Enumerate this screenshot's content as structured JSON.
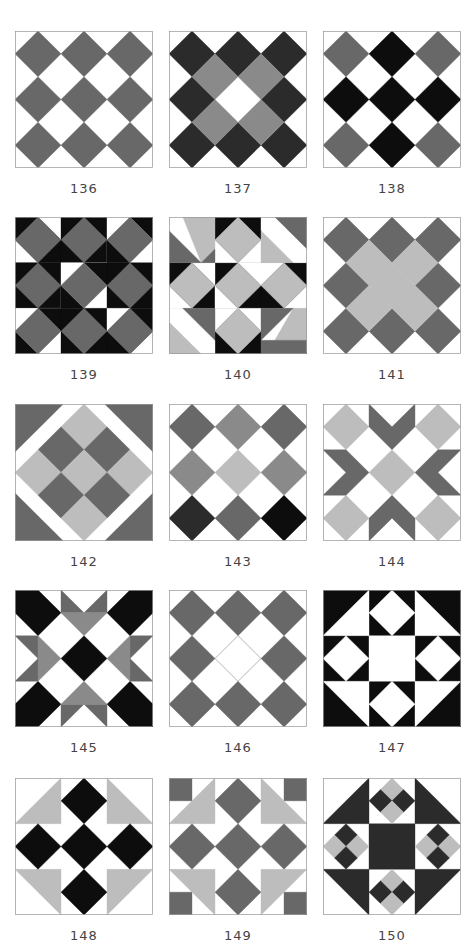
{
  "colors": {
    "white": "#ffffff",
    "black": "#0d0d0d",
    "dark": "#2b2b2b",
    "mid": "#686868",
    "gray": "#8a8a8a",
    "light": "#bdbdbd",
    "border": "#9a9a9a"
  },
  "layout": {
    "columns_x": [
      15,
      169,
      323
    ],
    "rows_y": [
      31,
      217,
      404,
      590,
      778
    ],
    "label_offset_y": 150
  },
  "blocks": [
    {
      "label": "136",
      "shapes": [
        {
          "c": "mid",
          "p": "0.5,0 1,0.5 0.5,1 0,0.5"
        },
        {
          "c": "mid",
          "p": "1.5,0 2,0.5 1.5,1 1,0.5"
        },
        {
          "c": "mid",
          "p": "2.5,0 3,0.5 2.5,1 2,0.5"
        },
        {
          "c": "mid",
          "p": "0.5,1 1,1.5 0.5,2 0,1.5"
        },
        {
          "c": "mid",
          "p": "1.5,1 2,1.5 1.5,2 1,1.5"
        },
        {
          "c": "mid",
          "p": "2.5,1 3,1.5 2.5,2 2,1.5"
        },
        {
          "c": "mid",
          "p": "0.5,2 1,2.5 0.5,3 0,2.5"
        },
        {
          "c": "mid",
          "p": "1.5,2 2,2.5 1.5,3 1,2.5"
        },
        {
          "c": "mid",
          "p": "2.5,2 3,2.5 2.5,3 2,2.5"
        }
      ]
    },
    {
      "label": "137",
      "shapes": [
        {
          "c": "dark",
          "p": "0.5,0 1,0.5 0.5,1 0,0.5"
        },
        {
          "c": "dark",
          "p": "1.5,0 2,0.5 1.5,1 1,0.5"
        },
        {
          "c": "dark",
          "p": "2.5,0 3,0.5 2.5,1 2,0.5"
        },
        {
          "c": "dark",
          "p": "0.5,1 1,1.5 0.5,2 0,1.5"
        },
        {
          "c": "dark",
          "p": "2.5,1 3,1.5 2.5,2 2,1.5"
        },
        {
          "c": "dark",
          "p": "0.5,2 1,2.5 0.5,3 0,2.5"
        },
        {
          "c": "dark",
          "p": "1.5,2 2,2.5 1.5,3 1,2.5"
        },
        {
          "c": "dark",
          "p": "2.5,2 3,2.5 2.5,3 2,2.5"
        },
        {
          "c": "gray",
          "p": "1,0.5 1.5,1 1,1.5 0.5,1"
        },
        {
          "c": "gray",
          "p": "2,0.5 2.5,1 2,1.5 1.5,1"
        },
        {
          "c": "gray",
          "p": "1,1.5 1.5,2 1,2.5 0.5,2"
        },
        {
          "c": "gray",
          "p": "2,1.5 2.5,2 2,2.5 1.5,2"
        }
      ]
    },
    {
      "label": "138",
      "shapes": [
        {
          "c": "mid",
          "p": "0.5,0 1,0.5 0.5,1 0,0.5"
        },
        {
          "c": "black",
          "p": "1.5,0 2,0.5 1.5,1 1,0.5"
        },
        {
          "c": "mid",
          "p": "2.5,0 3,0.5 2.5,1 2,0.5"
        },
        {
          "c": "black",
          "p": "0.5,1 1,1.5 0.5,2 0,1.5"
        },
        {
          "c": "black",
          "p": "1.5,1 2,1.5 1.5,2 1,1.5"
        },
        {
          "c": "black",
          "p": "2.5,1 3,1.5 2.5,2 2,1.5"
        },
        {
          "c": "mid",
          "p": "0.5,2 1,2.5 0.5,3 0,2.5"
        },
        {
          "c": "black",
          "p": "1.5,2 2,2.5 1.5,3 1,2.5"
        },
        {
          "c": "mid",
          "p": "2.5,2 3,2.5 2.5,3 2,2.5"
        }
      ]
    },
    {
      "label": "139",
      "shapes": [
        {
          "c": "black",
          "p": "0,0 1,0 1,1 0,1"
        },
        {
          "c": "white",
          "p": "0,0.5 0.5,1 0,1"
        },
        {
          "c": "white",
          "p": "1,0 1,0.5 0.5,0"
        },
        {
          "c": "black",
          "p": "1,0 2,0 2,1 1,1"
        },
        {
          "c": "white",
          "p": "2,0 3,0 3,1 2,1"
        },
        {
          "c": "black",
          "p": "2.5,0 3,0 3,0.5"
        },
        {
          "c": "black",
          "p": "2,0.5 2.5,1 2,1"
        },
        {
          "c": "black",
          "p": "0,1 1,1 1,2 0,2"
        },
        {
          "c": "white",
          "p": "1,1 2,1 2,2 1,2"
        },
        {
          "c": "black",
          "p": "1.5,1 2,1 2,1.5"
        },
        {
          "c": "black",
          "p": "1,1.5 1.5,2 1,2"
        },
        {
          "c": "black",
          "p": "2,1 3,1 3,2 2,2"
        },
        {
          "c": "white",
          "p": "0,2 1,2 1,3 0,3"
        },
        {
          "c": "black",
          "p": "0,2.5 0.5,3 0,3"
        },
        {
          "c": "black",
          "p": "0.5,2 1,2 1,2.5"
        },
        {
          "c": "black",
          "p": "1,2 2,2 2,3 1,3"
        },
        {
          "c": "black",
          "p": "2,2 3,2 3,3 2,3"
        },
        {
          "c": "white",
          "p": "2,2 2.5,2 2,2.5"
        },
        {
          "c": "white",
          "p": "3,2.5 3,3 2.5,3"
        },
        {
          "c": "mid",
          "p": "0.5,0 1,0.5 0.5,1 0,0.5"
        },
        {
          "c": "mid",
          "p": "1.5,0 2,0.5 1.5,1 1,0.5"
        },
        {
          "c": "mid",
          "p": "2.5,0 3,0.5 2.5,1 2,0.5"
        },
        {
          "c": "mid",
          "p": "0.5,1 1,1.5 0.5,2 0,1.5"
        },
        {
          "c": "mid",
          "p": "1.5,1 2,1.5 1.5,2 1,1.5"
        },
        {
          "c": "mid",
          "p": "2.5,1 3,1.5 2.5,2 2,1.5"
        },
        {
          "c": "mid",
          "p": "0.5,2 1,2.5 0.5,3 0,2.5"
        },
        {
          "c": "mid",
          "p": "1.5,2 2,2.5 1.5,3 1,2.5"
        },
        {
          "c": "mid",
          "p": "2.5,2 3,2.5 2.5,3 2,2.5"
        }
      ]
    },
    {
      "label": "140",
      "shapes": [
        {
          "c": "black",
          "p": "1,0 2,0 2,1 1,1"
        },
        {
          "c": "black",
          "p": "0,1 1,1 1,2 0,2"
        },
        {
          "c": "black",
          "p": "1,1 2,1 2,2 1,2"
        },
        {
          "c": "black",
          "p": "2,1 3,1 3,2 2,2"
        },
        {
          "c": "black",
          "p": "1,2 2,2 2,3 1,3"
        },
        {
          "c": "white",
          "p": "1,0.5 1.5,1 1,1"
        },
        {
          "c": "white",
          "p": "2,0.5 2,1 1.5,1"
        },
        {
          "c": "white",
          "p": "0.5,1 1,1 1,1.5"
        },
        {
          "c": "white",
          "p": "0,1.5 0.5,2 0,2"
        },
        {
          "c": "white",
          "p": "1.5,1 2,1 2,1.5"
        },
        {
          "c": "white",
          "p": "1,1.5 1.5,2 1,2"
        },
        {
          "c": "white",
          "p": "2,1 2.5,1 2,1.5"
        },
        {
          "c": "white",
          "p": "3,1.5 3,2 2.5,2"
        },
        {
          "c": "white",
          "p": "1,2 1.5,2 1,2.5"
        },
        {
          "c": "white",
          "p": "2,2 2,2.5 1.5,2"
        },
        {
          "c": "white",
          "p": "0,0 0.3,0 0,0.3"
        },
        {
          "c": "light",
          "p": "0.3,0 1,0 1,0.7 0.7,1"
        },
        {
          "c": "mid",
          "p": "0,0.3 0.7,1 0,1"
        },
        {
          "c": "mid",
          "p": "0.7,1 1,0.7 1,1"
        },
        {
          "c": "white",
          "p": "2,0 2.3,0 2,0.3"
        },
        {
          "c": "mid",
          "p": "2.3,0 3,0 3,0.7"
        },
        {
          "c": "light",
          "p": "2,0.3 2.7,1 2,1"
        },
        {
          "c": "white",
          "p": "3,0.7 3,1 2.7,1"
        },
        {
          "c": "white",
          "p": "0,2 0.3,2 0,2.3"
        },
        {
          "c": "mid",
          "p": "0.3,2 1,2 1,2.7"
        },
        {
          "c": "light",
          "p": "0,2.3 0.7,3 0,3"
        },
        {
          "c": "white",
          "p": "1,2.7 1,3 0.7,3"
        },
        {
          "c": "white",
          "p": "3,2 3,2.3 2.7,2"
        },
        {
          "c": "light",
          "p": "2.7,2 3,2 3,2.7 2.3,2.7"
        },
        {
          "c": "mid",
          "p": "2,2 2.7,2 2,2.7"
        },
        {
          "c": "mid",
          "p": "2,2.7 2.3,2.7 3,2.7 3,3 2,3"
        },
        {
          "c": "light",
          "p": "1.5,0 2,0.5 1.5,1 1,0.5"
        },
        {
          "c": "light",
          "p": "0.5,1 1,1.5 0.5,2 0,1.5"
        },
        {
          "c": "light",
          "p": "1.5,1 2,1.5 1.5,2 1,1.5"
        },
        {
          "c": "light",
          "p": "2.5,1 3,1.5 2.5,2 2,1.5"
        },
        {
          "c": "light",
          "p": "1.5,2 2,2.5 1.5,3 1,2.5"
        }
      ]
    },
    {
      "label": "141",
      "shapes": [
        {
          "c": "mid",
          "p": "0.5,0 1,0.5 0.5,1 0,0.5"
        },
        {
          "c": "mid",
          "p": "1.5,0 2,0.5 1.5,1 1,0.5"
        },
        {
          "c": "mid",
          "p": "2.5,0 3,0.5 2.5,1 2,0.5"
        },
        {
          "c": "mid",
          "p": "0.5,1 1,1.5 0.5,2 0,1.5"
        },
        {
          "c": "mid",
          "p": "2.5,1 3,1.5 2.5,2 2,1.5"
        },
        {
          "c": "mid",
          "p": "0.5,2 1,2.5 0.5,3 0,2.5"
        },
        {
          "c": "mid",
          "p": "1.5,2 2,2.5 1.5,3 1,2.5"
        },
        {
          "c": "mid",
          "p": "2.5,2 3,2.5 2.5,3 2,2.5"
        },
        {
          "c": "light",
          "p": "2,0.5 2.5,1 2,1.5 1.5,1"
        },
        {
          "c": "light",
          "p": "1,1.5 1.5,2 1,2.5 0.5,2"
        },
        {
          "c": "light",
          "p": "1,0.5 2.5,2 2,2.5 0.5,1"
        }
      ]
    },
    {
      "label": "142",
      "shapes": [
        {
          "c": "mid",
          "p": "0,0 1.05,0 0,1.05"
        },
        {
          "c": "mid",
          "p": "3,0 3,1.05 1.95,0"
        },
        {
          "c": "mid",
          "p": "0,3 0,1.95 1.05,3"
        },
        {
          "c": "mid",
          "p": "3,3 1.95,3 3,1.95"
        },
        {
          "c": "light",
          "p": "1.5,0 2,0.5 1.5,1 1,0.5"
        },
        {
          "c": "mid",
          "p": "2,0.5 2.5,1 2,1.5 1.5,1"
        },
        {
          "c": "mid",
          "p": "1,0.5 1.5,1 1,1.5 0.5,1"
        },
        {
          "c": "light",
          "p": "0.5,1 1,1.5 0.5,2 0,1.5"
        },
        {
          "c": "light",
          "p": "1.5,1 2,1.5 1.5,2 1,1.5"
        },
        {
          "c": "light",
          "p": "2.5,1 3,1.5 2.5,2 2,1.5"
        },
        {
          "c": "mid",
          "p": "1,1.5 1.5,2 1,2.5 0.5,2"
        },
        {
          "c": "mid",
          "p": "2,1.5 2.5,2 2,2.5 1.5,2"
        },
        {
          "c": "light",
          "p": "1.5,2 2,2.5 1.5,3 1,2.5"
        }
      ]
    },
    {
      "label": "143",
      "shapes": [
        {
          "c": "mid",
          "p": "0.5,0 1,0.5 0.5,1 0,0.5"
        },
        {
          "c": "gray",
          "p": "1.5,0 2,0.5 1.5,1 1,0.5"
        },
        {
          "c": "mid",
          "p": "2.5,0 3,0.5 2.5,1 2,0.5"
        },
        {
          "c": "gray",
          "p": "0.5,1 1,1.5 0.5,2 0,1.5"
        },
        {
          "c": "light",
          "p": "1.5,1 2,1.5 1.5,2 1,1.5"
        },
        {
          "c": "gray",
          "p": "2.5,1 3,1.5 2.5,2 2,1.5"
        },
        {
          "c": "dark",
          "p": "0.5,2 1,2.5 0.5,3 0,2.5"
        },
        {
          "c": "mid",
          "p": "1.5,2 2,2.5 1.5,3 1,2.5"
        },
        {
          "c": "black",
          "p": "2.5,2 3,2.5 2.5,3 2,2.5"
        }
      ]
    },
    {
      "label": "144",
      "shapes": [
        {
          "c": "light",
          "p": "0.5,0 1,0.5 0.5,1 0,0.5"
        },
        {
          "c": "light",
          "p": "2.5,0 3,0.5 2.5,1 2,0.5"
        },
        {
          "c": "light",
          "p": "1.5,1 2,1.5 1.5,2 1,1.5"
        },
        {
          "c": "light",
          "p": "0.5,2 1,2.5 0.5,3 0,2.5"
        },
        {
          "c": "light",
          "p": "2.5,2 3,2.5 2.5,3 2,2.5"
        },
        {
          "c": "mid",
          "p": "1,0 1.5,0.5 2,0 2,0.5 1.5,1 1,0.5"
        },
        {
          "c": "mid",
          "p": "1,3 1.5,2.5 2,3 2,2.5 1.5,2 1,2.5"
        },
        {
          "c": "mid",
          "p": "0,1 0.5,1 1,1.5 0.5,2 0,2 0.5,1.5"
        },
        {
          "c": "mid",
          "p": "3,1 2.5,1 2,1.5 2.5,2 3,2 2.5,1.5"
        }
      ]
    },
    {
      "label": "145",
      "shapes": [
        {
          "c": "black",
          "p": "0,0 0.5,0 1,0.5 0.5,1 0,0.5"
        },
        {
          "c": "black",
          "p": "3,0 3,0.5 2.5,1 2,0.5 2.5,0"
        },
        {
          "c": "black",
          "p": "0,3 0,2.5 0.5,2 1,2.5 0.5,3"
        },
        {
          "c": "black",
          "p": "3,3 2.5,3 2,2.5 2.5,2 3,2.5"
        },
        {
          "c": "black",
          "p": "1.5,1 2,1.5 1.5,2 1,1.5"
        },
        {
          "c": "mid",
          "p": "1,0 1.5,0.5 1,0.5"
        },
        {
          "c": "mid",
          "p": "2,0 2,0.5 1.5,0.5"
        },
        {
          "c": "gray",
          "p": "1,0.5 2,0.5 1.5,1"
        },
        {
          "c": "mid",
          "p": "1,3 1,2.5 1.5,2.5"
        },
        {
          "c": "mid",
          "p": "2,3 1.5,2.5 2,2.5"
        },
        {
          "c": "gray",
          "p": "1,2.5 1.5,2 2,2.5"
        },
        {
          "c": "mid",
          "p": "0,1 0.5,1 0.5,1.5"
        },
        {
          "c": "mid",
          "p": "0,2 0.5,1.5 0.5,2"
        },
        {
          "c": "gray",
          "p": "0.5,1 1,1.5 0.5,2"
        },
        {
          "c": "mid",
          "p": "3,1 2.5,1 2.5,1.5"
        },
        {
          "c": "mid",
          "p": "3,2 2.5,2 2.5,1.5"
        },
        {
          "c": "gray",
          "p": "2.5,1 2,1.5 2.5,2"
        }
      ]
    },
    {
      "label": "146",
      "shapes": [
        {
          "c": "mid",
          "p": "0.5,0 1,0.5 0.5,1 0,0.5"
        },
        {
          "c": "mid",
          "p": "1.5,0 2,0.5 1.5,1 1,0.5"
        },
        {
          "c": "mid",
          "p": "2.5,0 3,0.5 2.5,1 2,0.5"
        },
        {
          "c": "mid",
          "p": "0.5,1 1,1.5 0.5,2 0,1.5"
        },
        {
          "c": "white",
          "p": "1.5,1 2,1.5 1.5,2 1,1.5",
          "stroke": true
        },
        {
          "c": "mid",
          "p": "2.5,1 3,1.5 2.5,2 2,1.5"
        },
        {
          "c": "mid",
          "p": "0.5,2 1,2.5 0.5,3 0,2.5"
        },
        {
          "c": "mid",
          "p": "1.5,2 2,2.5 1.5,3 1,2.5"
        },
        {
          "c": "mid",
          "p": "2.5,2 3,2.5 2.5,3 2,2.5"
        }
      ]
    },
    {
      "label": "147",
      "shapes": [
        {
          "c": "black",
          "p": "0,0 3,0 3,3 0,3"
        },
        {
          "c": "white",
          "p": "1,0 1,1 0,1"
        },
        {
          "c": "white",
          "p": "2,0 3,1 2,1"
        },
        {
          "c": "white",
          "p": "0,2 1,2 1,3"
        },
        {
          "c": "white",
          "p": "2,2 3,2 2,3"
        },
        {
          "c": "white",
          "p": "1,1 2,1 2,2 1,2"
        },
        {
          "c": "white",
          "p": "1.5,0 2,0.5 1.5,1 1,0.5"
        },
        {
          "c": "white",
          "p": "0.5,1 1,1.5 0.5,2 0,1.5"
        },
        {
          "c": "white",
          "p": "2.5,1 3,1.5 2.5,2 2,1.5"
        },
        {
          "c": "white",
          "p": "1.5,2 2,2.5 1.5,3 1,2.5"
        }
      ]
    },
    {
      "label": "148",
      "shapes": [
        {
          "c": "light",
          "p": "1,0 1,1 0,1"
        },
        {
          "c": "light",
          "p": "2,0 3,1 2,1"
        },
        {
          "c": "light",
          "p": "0,2 1,2 1,3"
        },
        {
          "c": "light",
          "p": "2,2 3,2 2,3"
        },
        {
          "c": "black",
          "p": "1.5,0 2,0.5 1.5,1 1,0.5"
        },
        {
          "c": "black",
          "p": "0.5,1 1,1.5 0.5,2 0,1.5"
        },
        {
          "c": "black",
          "p": "1.5,1 2,1.5 1.5,2 1,1.5"
        },
        {
          "c": "black",
          "p": "2.5,1 3,1.5 2.5,2 2,1.5"
        },
        {
          "c": "black",
          "p": "1.5,2 2,2.5 1.5,3 1,2.5"
        }
      ]
    },
    {
      "label": "149",
      "shapes": [
        {
          "c": "mid",
          "p": "0,0 0.5,0 0.5,0.5 0,0.5"
        },
        {
          "c": "mid",
          "p": "2.5,0 3,0 3,0.5 2.5,0.5"
        },
        {
          "c": "mid",
          "p": "0,2.5 0.5,2.5 0.5,3 0,3"
        },
        {
          "c": "mid",
          "p": "2.5,2.5 3,2.5 3,3 2.5,3"
        },
        {
          "c": "light",
          "p": "1,0 1,1 0,1"
        },
        {
          "c": "light",
          "p": "2,0 3,1 2,1"
        },
        {
          "c": "light",
          "p": "0,2 1,2 1,3"
        },
        {
          "c": "light",
          "p": "2,2 3,2 2,3"
        },
        {
          "c": "mid",
          "p": "1.5,0 2,0.5 1.5,1 1,0.5"
        },
        {
          "c": "mid",
          "p": "0.5,1 1,1.5 0.5,2 0,1.5"
        },
        {
          "c": "mid",
          "p": "1.5,1 2,1.5 1.5,2 1,1.5"
        },
        {
          "c": "mid",
          "p": "2.5,1 3,1.5 2.5,2 2,1.5"
        },
        {
          "c": "mid",
          "p": "1.5,2 2,2.5 1.5,3 1,2.5"
        }
      ]
    },
    {
      "label": "150",
      "shapes": [
        {
          "c": "dark",
          "p": "1,0 1,1 0,1"
        },
        {
          "c": "dark",
          "p": "2,0 3,1 2,1"
        },
        {
          "c": "dark",
          "p": "0,2 1,2 1,3"
        },
        {
          "c": "dark",
          "p": "2,2 3,2 2,3"
        },
        {
          "c": "dark",
          "p": "1,1 2,1 2,2 1,2"
        },
        {
          "c": "light",
          "p": "1.5,0 1.75,0.25 1.5,0.5 1.25,0.25"
        },
        {
          "c": "dark",
          "p": "1.25,0.25 1.5,0.5 1.25,0.75 1,0.5"
        },
        {
          "c": "dark",
          "p": "1.75,0.25 2,0.5 1.75,0.75 1.5,0.5"
        },
        {
          "c": "light",
          "p": "1.5,0.5 1.75,0.75 1.5,1 1.25,0.75"
        },
        {
          "c": "light",
          "p": "1.5,2 1.75,2.25 1.5,2.5 1.25,2.25"
        },
        {
          "c": "dark",
          "p": "1.25,2.25 1.5,2.5 1.25,2.75 1,2.5"
        },
        {
          "c": "dark",
          "p": "1.75,2.25 2,2.5 1.75,2.75 1.5,2.5"
        },
        {
          "c": "light",
          "p": "1.5,2.5 1.75,2.75 1.5,3 1.25,2.75"
        },
        {
          "c": "dark",
          "p": "0.5,1 0.75,1.25 0.5,1.5 0.25,1.25"
        },
        {
          "c": "light",
          "p": "0.25,1.25 0.5,1.5 0.25,1.75 0,1.5"
        },
        {
          "c": "light",
          "p": "0.75,1.25 1,1.5 0.75,1.75 0.5,1.5"
        },
        {
          "c": "dark",
          "p": "0.5,1.5 0.75,1.75 0.5,2 0.25,1.75"
        },
        {
          "c": "dark",
          "p": "2.5,1 2.75,1.25 2.5,1.5 2.25,1.25"
        },
        {
          "c": "light",
          "p": "2.25,1.25 2.5,1.5 2.25,1.75 2,1.5"
        },
        {
          "c": "light",
          "p": "2.75,1.25 3,1.5 2.75,1.75 2.5,1.5"
        },
        {
          "c": "dark",
          "p": "2.5,1.5 2.75,1.75 2.5,2 2.25,1.75"
        }
      ]
    }
  ]
}
